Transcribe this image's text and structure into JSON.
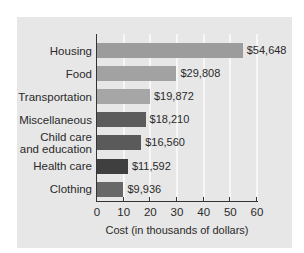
{
  "chart_data": {
    "type": "bar",
    "orientation": "horizontal",
    "title": "",
    "xlabel": "Cost (in thousands of dollars)",
    "ylabel": "",
    "xlim": [
      0,
      60
    ],
    "xticks": [
      "0",
      "10",
      "20",
      "30",
      "40",
      "50",
      "60"
    ],
    "grid": true,
    "legend": null,
    "categories": [
      "Housing",
      "Food",
      "Transportation",
      "Miscellaneous",
      "Child care and education",
      "Health care",
      "Clothing"
    ],
    "category_lines": [
      [
        "Housing"
      ],
      [
        "Food"
      ],
      [
        "Transportation"
      ],
      [
        "Miscellaneous"
      ],
      [
        "Child care",
        "and education"
      ],
      [
        "Health care"
      ],
      [
        "Clothing"
      ]
    ],
    "values": [
      54.648,
      29.808,
      19.872,
      18.21,
      16.56,
      11.592,
      9.936
    ],
    "value_labels": [
      "$54,648",
      "$29,808",
      "$19,872",
      "$18,210",
      "$16,560",
      "$11,592",
      "$9,936"
    ],
    "colors": [
      "#9c9c9c",
      "#a2a2a2",
      "#a6a6a6",
      "#5c5c5c",
      "#5a5a5a",
      "#3f3f3f",
      "#686868"
    ]
  }
}
